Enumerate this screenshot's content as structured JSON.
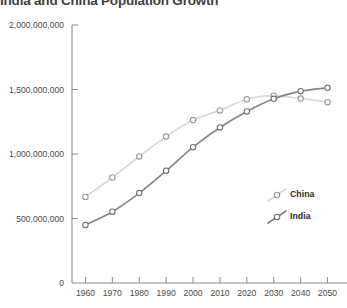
{
  "chart_data": {
    "type": "line",
    "title": "India and China Population Growth",
    "xlabel": "",
    "ylabel": "",
    "x": [
      1960,
      1970,
      1980,
      1990,
      2000,
      2010,
      2020,
      2030,
      2040,
      2050
    ],
    "categories": [
      "1960",
      "1970",
      "1980",
      "1990",
      "2000",
      "2010",
      "2020",
      "2030",
      "2040",
      "2050"
    ],
    "xlim": [
      1955,
      2055
    ],
    "ylim": [
      0,
      2000000000
    ],
    "grid": false,
    "legend_position": "right",
    "ytick_labels": [
      "0",
      "500,000,000",
      "1,000,000,000",
      "1,500,000,000",
      "2,000,000,000"
    ],
    "ytick_values": [
      0,
      500000000,
      1000000000,
      1500000000,
      2000000000
    ],
    "series": [
      {
        "name": "China",
        "color": "#d9d9d9",
        "marker": "open-circle",
        "marker_stroke": "#9a9a9a",
        "values": [
          667000000,
          818000000,
          981000000,
          1135000000,
          1263000000,
          1338000000,
          1424000000,
          1452000000,
          1430000000,
          1402000000
        ]
      },
      {
        "name": "India",
        "color": "#878787",
        "marker": "open-circle",
        "marker_stroke": "#6f6f6f",
        "values": [
          450000000,
          553000000,
          697000000,
          870000000,
          1053000000,
          1206000000,
          1330000000,
          1428000000,
          1487000000,
          1513000000
        ]
      }
    ]
  }
}
